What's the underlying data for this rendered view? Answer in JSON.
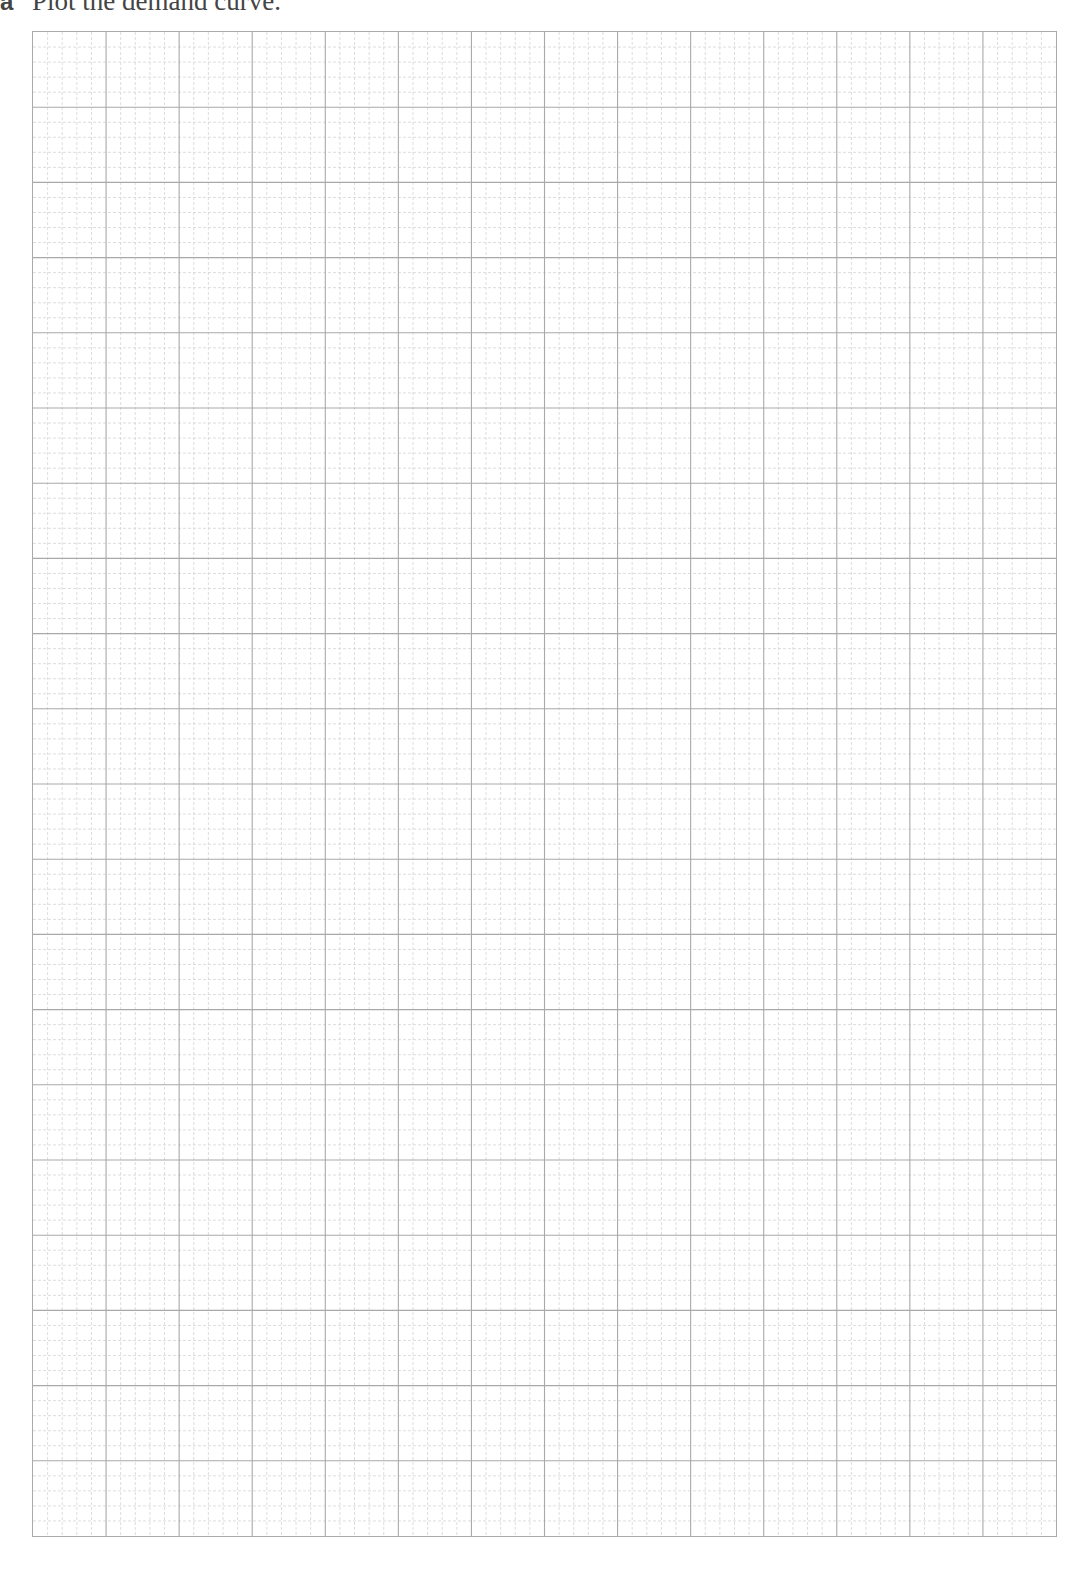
{
  "question": {
    "label": "a",
    "text": "Plot the demand curve."
  },
  "graph_paper": {
    "major_columns": 14,
    "major_rows": 20,
    "minor_subdivisions": 5,
    "major_line_color": "#a9a9a9",
    "minor_line_color": "#d4d4d4",
    "border_color": "#aaaaaa"
  }
}
